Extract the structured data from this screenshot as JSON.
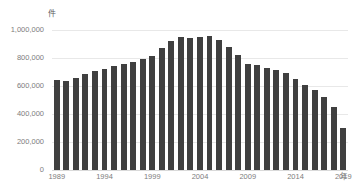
{
  "chart_data": {
    "type": "bar",
    "title": "",
    "subtitle": "",
    "xlabel": "年",
    "ylabel": "件",
    "ylim": [
      0,
      1000000
    ],
    "grid": true,
    "legend": "none",
    "y_ticks": [
      "0",
      "200,000",
      "400,000",
      "600,000",
      "800,000",
      "1,000,000"
    ],
    "y_tick_values": [
      0,
      200000,
      400000,
      600000,
      800000,
      1000000
    ],
    "x_tick_labels": [
      "1989",
      "1994",
      "1999",
      "2004",
      "2009",
      "2014",
      "2019"
    ],
    "x_tick_values": [
      1989,
      1994,
      1999,
      2004,
      2009,
      2014,
      2019
    ],
    "categories": [
      "1989",
      "1990",
      "1991",
      "1992",
      "1993",
      "1994",
      "1995",
      "1996",
      "1997",
      "1998",
      "1999",
      "2000",
      "2001",
      "2002",
      "2003",
      "2004",
      "2005",
      "2006",
      "2007",
      "2008",
      "2009",
      "2010",
      "2011",
      "2012",
      "2013",
      "2014",
      "2015",
      "2016",
      "2017",
      "2018",
      "2019"
    ],
    "values": [
      642000,
      636000,
      656000,
      686000,
      708000,
      722000,
      740000,
      760000,
      775000,
      790000,
      815000,
      870000,
      925000,
      950000,
      945000,
      950000,
      955000,
      930000,
      880000,
      820000,
      760000,
      750000,
      730000,
      715000,
      690000,
      650000,
      610000,
      570000,
      520000,
      450000,
      300000
    ],
    "bar_color": "#404040",
    "background_color": "#ffffff",
    "gridline_color": "#e8e8e8",
    "tick_label_color": "#7d7d7d"
  }
}
